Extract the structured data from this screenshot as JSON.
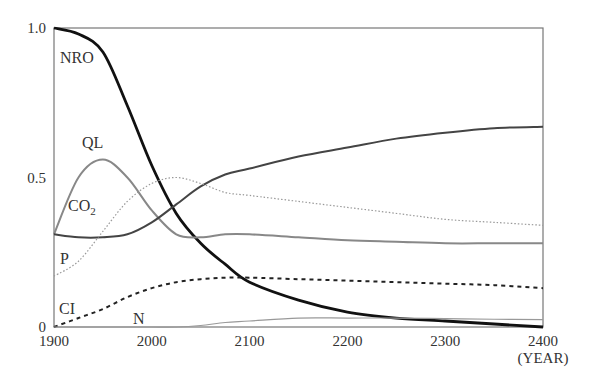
{
  "chart_data": {
    "type": "line",
    "title": "",
    "xlabel": "(YEAR)",
    "ylabel": "",
    "xlim": [
      1900,
      2400
    ],
    "ylim": [
      0,
      1.0
    ],
    "x_ticks": [
      "1900",
      "2000",
      "2100",
      "2200",
      "2300",
      "2400"
    ],
    "y_ticks": [
      "0",
      "0.5",
      "1.0"
    ],
    "grid": false,
    "legend": "inline labels",
    "x": [
      1900,
      1925,
      1950,
      1975,
      2000,
      2025,
      2050,
      2075,
      2100,
      2150,
      2200,
      2250,
      2300,
      2350,
      2400
    ],
    "series": [
      {
        "name": "NRO",
        "style": "thick solid black",
        "values": [
          1.0,
          0.98,
          0.92,
          0.74,
          0.54,
          0.38,
          0.28,
          0.21,
          0.15,
          0.09,
          0.05,
          0.03,
          0.02,
          0.01,
          0.0
        ]
      },
      {
        "name": "QL",
        "style": "solid gray",
        "values": [
          0.31,
          0.5,
          0.56,
          0.5,
          0.39,
          0.31,
          0.3,
          0.31,
          0.31,
          0.3,
          0.29,
          0.285,
          0.28,
          0.28,
          0.28
        ]
      },
      {
        "name": "CO2",
        "style": "solid dark gray",
        "values": [
          0.31,
          0.3,
          0.3,
          0.31,
          0.35,
          0.41,
          0.47,
          0.51,
          0.53,
          0.57,
          0.6,
          0.63,
          0.65,
          0.665,
          0.67
        ]
      },
      {
        "name": "P",
        "style": "dotted gray",
        "values": [
          0.17,
          0.22,
          0.32,
          0.42,
          0.48,
          0.5,
          0.48,
          0.45,
          0.44,
          0.42,
          0.4,
          0.38,
          0.36,
          0.35,
          0.34
        ]
      },
      {
        "name": "CI",
        "style": "dashed black",
        "values": [
          0.0,
          0.03,
          0.06,
          0.1,
          0.13,
          0.15,
          0.16,
          0.165,
          0.165,
          0.16,
          0.155,
          0.15,
          0.145,
          0.14,
          0.13
        ]
      },
      {
        "name": "N",
        "style": "thin solid gray",
        "values": [
          0.0,
          0.0,
          0.0,
          0.0,
          0.0,
          0.0,
          0.005,
          0.015,
          0.02,
          0.03,
          0.03,
          0.03,
          0.028,
          0.026,
          0.025
        ]
      }
    ]
  },
  "labels": {
    "nro": "NRO",
    "ql": "QL",
    "co2": "CO",
    "co2_sub": "2",
    "p": "P",
    "ci": "CI",
    "n": "N",
    "year": "(YEAR)"
  }
}
